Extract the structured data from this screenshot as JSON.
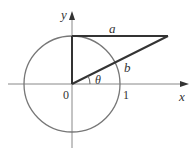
{
  "figure": {
    "type": "unit-circle-diagram",
    "labels": {
      "y_axis": "y",
      "x_axis": "x",
      "origin": "0",
      "unit_tick": "1",
      "top_segment": "a",
      "hypotenuse": "b",
      "angle": "θ"
    },
    "colors": {
      "axis": "#888888",
      "circle": "#777777",
      "segment": "#333333",
      "text": "#333333",
      "background": "#ffffff"
    }
  }
}
